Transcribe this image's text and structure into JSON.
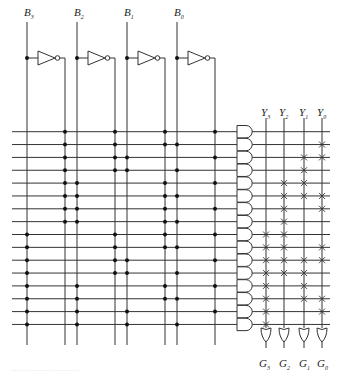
{
  "diagram": {
    "type": "PLA logic circuit (AND-OR array)",
    "inputs": [
      {
        "name": "B",
        "sub": "3"
      },
      {
        "name": "B",
        "sub": "2"
      },
      {
        "name": "B",
        "sub": "1"
      },
      {
        "name": "B",
        "sub": "0"
      }
    ],
    "or_columns": [
      {
        "name": "Y",
        "sub": "3"
      },
      {
        "name": "Y",
        "sub": "2"
      },
      {
        "name": "Y",
        "sub": "1"
      },
      {
        "name": "Y",
        "sub": "0"
      }
    ],
    "outputs": [
      {
        "name": "G",
        "sub": "3"
      },
      {
        "name": "G",
        "sub": "2"
      },
      {
        "name": "G",
        "sub": "1"
      },
      {
        "name": "G",
        "sub": "0"
      }
    ],
    "and_array": {
      "note": "each row lists literal per input B3,B2,B1,B0: 1 = true line, 0 = complement line",
      "rows": [
        [
          0,
          0,
          0,
          0
        ],
        [
          0,
          0,
          0,
          1
        ],
        [
          0,
          0,
          1,
          0
        ],
        [
          0,
          0,
          1,
          1
        ],
        [
          0,
          1,
          0,
          0
        ],
        [
          0,
          1,
          0,
          1
        ],
        [
          0,
          1,
          0,
          0
        ],
        [
          0,
          1,
          0,
          1
        ],
        [
          1,
          0,
          0,
          0
        ],
        [
          1,
          0,
          0,
          1
        ],
        [
          1,
          0,
          1,
          0
        ],
        [
          1,
          0,
          1,
          1
        ],
        [
          1,
          1,
          0,
          0
        ],
        [
          1,
          1,
          0,
          1
        ],
        [
          1,
          1,
          1,
          0
        ],
        [
          1,
          1,
          1,
          1
        ]
      ]
    },
    "or_array": {
      "note": "rows (product terms) connected to each OR column",
      "Y3": [
        8,
        9,
        10,
        11,
        12,
        13,
        14,
        15
      ],
      "Y2": [
        4,
        5,
        6,
        7,
        8,
        9,
        10,
        11
      ],
      "Y1": [
        2,
        3,
        4,
        5,
        10,
        11,
        12,
        13
      ],
      "Y0": [
        1,
        2,
        5,
        6,
        9,
        10,
        13,
        14
      ]
    }
  },
  "caption": "................................"
}
